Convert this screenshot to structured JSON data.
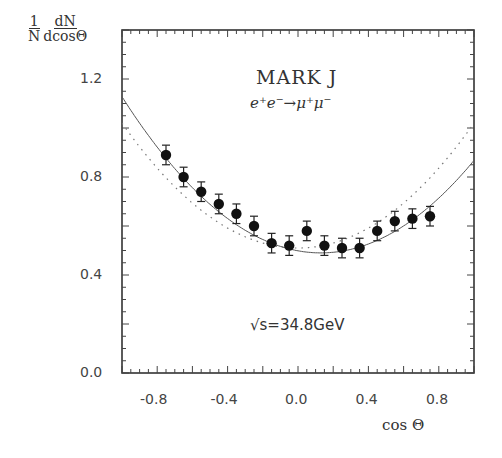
{
  "chart_data": {
    "type": "scatter",
    "title": "MARK J",
    "subtitle": "e⁺e⁻→μ⁺μ⁻",
    "annotation": "√s=34.8GeV",
    "xlabel": "cos Θ",
    "ylabel_numerator_left": "1",
    "ylabel_denominator_left": "N",
    "ylabel_numerator_right": "dN",
    "ylabel_denominator_right": "dcosΘ",
    "xlim": [
      -1.0,
      1.0
    ],
    "ylim": [
      0.0,
      1.4
    ],
    "x_tick_labels": [
      "-0.8",
      "-0.4",
      "0.0",
      "0.4",
      "0.8"
    ],
    "x_ticks": [
      -0.8,
      -0.4,
      0.0,
      0.4,
      0.8
    ],
    "y_tick_labels": [
      "0.0",
      "0.4",
      "0.8",
      "1.2"
    ],
    "y_ticks": [
      0.0,
      0.4,
      0.8,
      1.2
    ],
    "grid": false,
    "series": [
      {
        "name": "Data",
        "style": "points-with-errorbars",
        "x": [
          -0.75,
          -0.65,
          -0.55,
          -0.45,
          -0.35,
          -0.25,
          -0.15,
          -0.05,
          0.05,
          0.15,
          0.25,
          0.35,
          0.45,
          0.55,
          0.65,
          0.75
        ],
        "y": [
          0.89,
          0.8,
          0.74,
          0.69,
          0.65,
          0.6,
          0.53,
          0.52,
          0.58,
          0.52,
          0.51,
          0.51,
          0.58,
          0.62,
          0.63,
          0.64
        ],
        "err": [
          0.04,
          0.04,
          0.04,
          0.04,
          0.04,
          0.04,
          0.04,
          0.04,
          0.04,
          0.04,
          0.04,
          0.04,
          0.04,
          0.04,
          0.04,
          0.04
        ]
      },
      {
        "name": "Fit (with asymmetry)",
        "style": "solid",
        "formula": "0.375*(1+x^2) + A*x",
        "A": -0.13
      },
      {
        "name": "QED (no asymmetry)",
        "style": "dotted",
        "formula": "0.375*(1+x^2)*k",
        "scale": 1.0
      }
    ]
  }
}
